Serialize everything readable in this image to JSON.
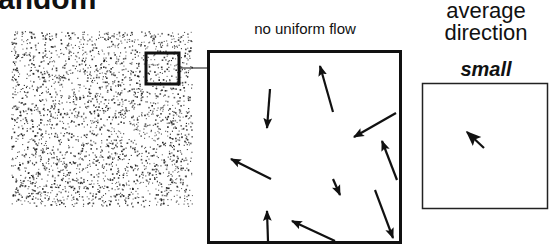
{
  "heading": "andom",
  "panels": {
    "noise": {
      "label": "random dot field",
      "dot_color": "#1a1a1a"
    },
    "zoomed": {
      "caption": "no uniform flow",
      "arrows": [
        {
          "x1": 270,
          "y1": 89,
          "x2": 267,
          "y2": 128
        },
        {
          "x1": 333,
          "y1": 112,
          "x2": 320,
          "y2": 66
        },
        {
          "x1": 396,
          "y1": 113,
          "x2": 354,
          "y2": 137
        },
        {
          "x1": 397,
          "y1": 180,
          "x2": 382,
          "y2": 141
        },
        {
          "x1": 271,
          "y1": 179,
          "x2": 231,
          "y2": 159
        },
        {
          "x1": 333,
          "y1": 179,
          "x2": 340,
          "y2": 195
        },
        {
          "x1": 375,
          "y1": 190,
          "x2": 393,
          "y2": 238
        },
        {
          "x1": 268,
          "y1": 241,
          "x2": 267,
          "y2": 211
        },
        {
          "x1": 335,
          "y1": 241,
          "x2": 292,
          "y2": 221
        }
      ]
    },
    "average": {
      "caption_line1": "average",
      "caption_line2": "direction",
      "label": "small",
      "arrow": {
        "x1": 484,
        "y1": 148,
        "x2": 467,
        "y2": 132
      }
    }
  },
  "colors": {
    "ink": "#111111",
    "background": "#ffffff"
  }
}
